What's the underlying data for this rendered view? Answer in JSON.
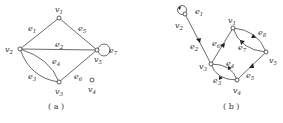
{
  "figure": {
    "graphs": [
      {
        "id": "a",
        "caption": "( a )",
        "directed": false,
        "vertices": [
          {
            "name": "v",
            "sub": "1",
            "x": 59,
            "y": 18,
            "lx": 55,
            "ly": 12
          },
          {
            "name": "v",
            "sub": "2",
            "x": 20,
            "y": 49,
            "lx": 5,
            "ly": 52
          },
          {
            "name": "v",
            "sub": "3",
            "x": 59,
            "y": 82,
            "lx": 55,
            "ly": 94
          },
          {
            "name": "v",
            "sub": "4",
            "x": 92,
            "y": 80,
            "lx": 88,
            "ly": 92
          },
          {
            "name": "v",
            "sub": "5",
            "x": 97,
            "y": 50,
            "lx": 94,
            "ly": 62
          }
        ],
        "edges": [
          {
            "name": "e",
            "sub": "1",
            "from": "v1",
            "to": "v2",
            "lx": 28,
            "ly": 31
          },
          {
            "name": "e",
            "sub": "2",
            "from": "v2",
            "to": "v5",
            "lx": 55,
            "ly": 47
          },
          {
            "name": "e",
            "sub": "3",
            "from": "v2",
            "to": "v3",
            "curve": "outer",
            "lx": 28,
            "ly": 79
          },
          {
            "name": "e",
            "sub": "4",
            "from": "v2",
            "to": "v3",
            "curve": "inner",
            "lx": 52,
            "ly": 64
          },
          {
            "name": "e",
            "sub": "5",
            "from": "v1",
            "to": "v5",
            "lx": 78,
            "ly": 31
          },
          {
            "name": "e",
            "sub": "6",
            "from": "v3",
            "to": "v5",
            "lx": 74,
            "ly": 79
          },
          {
            "name": "e",
            "sub": "7",
            "from": "v5",
            "to": "v5",
            "loop": true,
            "lx": 109,
            "ly": 53
          }
        ]
      },
      {
        "id": "b",
        "caption": "( b )",
        "directed": true,
        "vertices": [
          {
            "name": "v",
            "sub": "1",
            "x": 233,
            "y": 28,
            "lx": 228,
            "ly": 23
          },
          {
            "name": "v",
            "sub": "2",
            "x": 185,
            "y": 14,
            "lx": 175,
            "ly": 28
          },
          {
            "name": "v",
            "sub": "3",
            "x": 211,
            "y": 64,
            "lx": 199,
            "ly": 69
          },
          {
            "name": "v",
            "sub": "4",
            "x": 237,
            "y": 80,
            "lx": 233,
            "ly": 93
          },
          {
            "name": "v",
            "sub": "5",
            "x": 266,
            "y": 52,
            "lx": 269,
            "ly": 63
          }
        ],
        "edges": [
          {
            "name": "e",
            "sub": "1",
            "from": "v2",
            "to": "v2",
            "loop": true,
            "lx": 195,
            "ly": 14
          },
          {
            "name": "e",
            "sub": "2",
            "from": "v2",
            "to": "v3",
            "lx": 190,
            "ly": 49
          },
          {
            "name": "e",
            "sub": "3",
            "from": "v3",
            "to": "v4",
            "curve": "lower",
            "lx": 213,
            "ly": 83
          },
          {
            "name": "e",
            "sub": "4",
            "from": "v3",
            "to": "v4",
            "curve": "upper",
            "lx": 226,
            "ly": 66
          },
          {
            "name": "e",
            "sub": "5",
            "from": "v4",
            "to": "v5",
            "lx": 246,
            "ly": 78
          },
          {
            "name": "e",
            "sub": "6",
            "from": "v3",
            "to": "v1",
            "lx": 212,
            "ly": 46
          },
          {
            "name": "e",
            "sub": "7",
            "from": "v5",
            "to": "v1",
            "curve": "lower",
            "lx": 238,
            "ly": 50
          },
          {
            "name": "e",
            "sub": "8",
            "from": "v1",
            "to": "v5",
            "curve": "upper",
            "lx": 258,
            "ly": 35
          }
        ]
      }
    ]
  }
}
